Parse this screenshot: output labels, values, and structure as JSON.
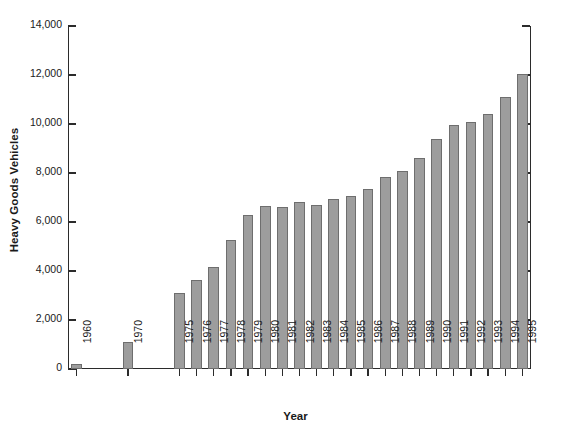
{
  "chart_data": {
    "type": "bar",
    "title": "",
    "xlabel": "Year",
    "ylabel": "Heavy Goods Vehicles",
    "categories": [
      "1960",
      "1970",
      "1975",
      "1976",
      "1977",
      "1978",
      "1979",
      "1980",
      "1981",
      "1982",
      "1983",
      "1984",
      "1985",
      "1986",
      "1987",
      "1988",
      "1989",
      "1990",
      "1991",
      "1992",
      "1993",
      "1994",
      "1995"
    ],
    "values": [
      200,
      1100,
      3100,
      3650,
      4150,
      5250,
      6300,
      6650,
      6600,
      6800,
      6700,
      6950,
      7050,
      7350,
      7850,
      8100,
      8600,
      9400,
      9950,
      10100,
      10400,
      11100,
      12050
    ],
    "ylim": [
      0,
      14000
    ],
    "xlim_note": "categorical with gaps after 1960 and 1970",
    "ytick_labels": [
      "0",
      "2,000",
      "4,000",
      "6,000",
      "8,000",
      "10,000",
      "12,000",
      "14,000"
    ],
    "ytick_values": [
      0,
      2000,
      4000,
      6000,
      8000,
      10000,
      12000,
      14000
    ],
    "grid": false,
    "legend": null,
    "bar_color": "#9d9d9d",
    "bar_edge_color": "#6e6e6e",
    "axis_color": "#2b2b2b",
    "slot_positions": [
      0,
      3,
      6,
      7,
      8,
      9,
      10,
      11,
      12,
      13,
      14,
      15,
      16,
      17,
      18,
      19,
      20,
      21,
      22,
      23,
      24,
      25,
      26
    ],
    "slot_count": 27
  }
}
